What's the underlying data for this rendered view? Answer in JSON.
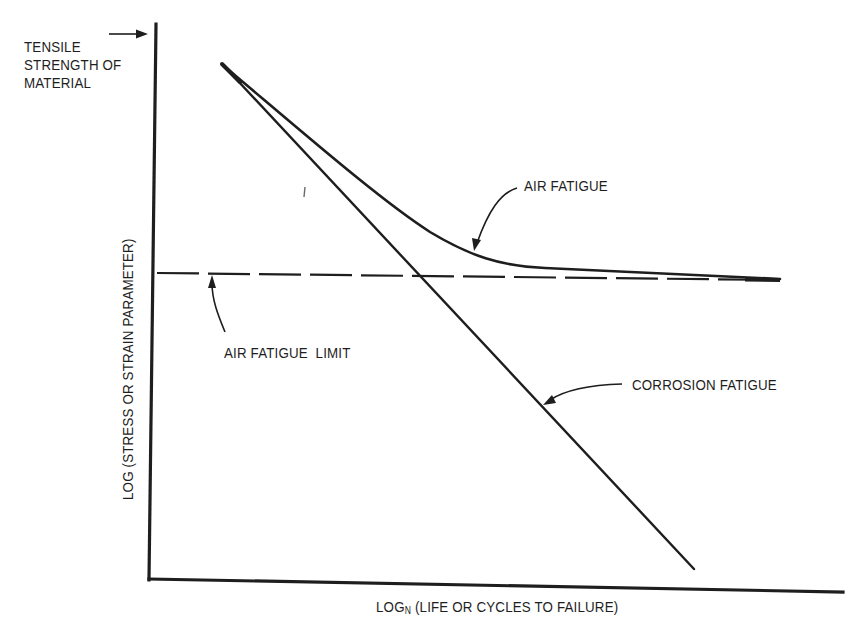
{
  "figure": {
    "type": "schematic S-N fatigue diagram",
    "tensile_label": {
      "lines": [
        "TENSILE",
        "STRENGTH OF",
        "MATERIAL"
      ]
    },
    "y_axis": {
      "label": "LOG (STRESS OR STRAIN PARAMETER)"
    },
    "x_axis": {
      "label_prefix": "LOG",
      "label_subscript": "N",
      "label_suffix": " (LIFE OR CYCLES TO FAILURE)"
    },
    "curves": {
      "air_fatigue": {
        "label": "AIR FATIGUE",
        "style": "solid curve, decreasing then leveling off to the fatigue limit"
      },
      "air_fatigue_limit": {
        "label": "AIR FATIGUE  LIMIT",
        "style": "dashed horizontal line"
      },
      "corrosion_fatigue": {
        "label": "CORROSION FATIGUE",
        "style": "solid straight line, continuing to decrease with no limit"
      }
    },
    "colors": {
      "ink": "#1e1e1e",
      "background": "#ffffff"
    }
  }
}
